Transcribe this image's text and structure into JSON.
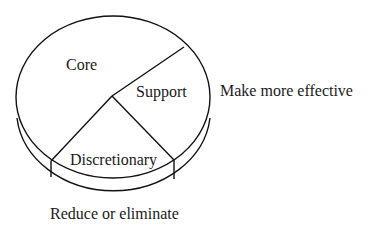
{
  "diagram": {
    "type": "pie-diagram",
    "segments": [
      {
        "id": "core",
        "label": "Core"
      },
      {
        "id": "support",
        "label": "Support"
      },
      {
        "id": "discretionary",
        "label": "Discretionary"
      }
    ],
    "annotations": {
      "support": "Make more effective",
      "discretionary": "Reduce or eliminate"
    },
    "colors": {
      "stroke": "#111111",
      "text": "#1a1a1a",
      "background": "#ffffff"
    }
  }
}
